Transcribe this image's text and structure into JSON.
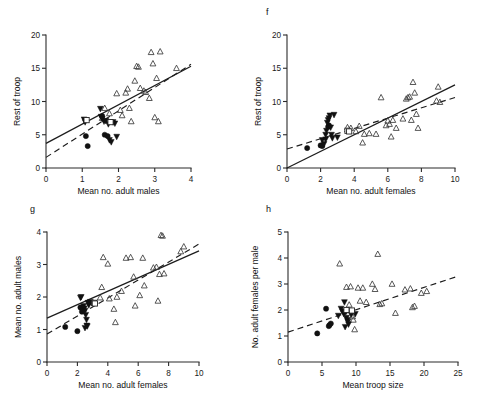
{
  "figure": {
    "title": "",
    "background": "#ffffff",
    "ink_color": "#1a1a1a",
    "width": 479,
    "height": 399
  },
  "legend_symbols": [
    {
      "key": "open-triangle",
      "name": "open-triangle-marker",
      "description": "open upward triangle"
    },
    {
      "key": "filled-circle",
      "name": "filled-circle-marker",
      "description": "filled circle"
    },
    {
      "key": "filled-down-triangle",
      "name": "filled-down-triangle-marker",
      "description": "filled downward triangle"
    },
    {
      "key": "open-square",
      "name": "open-square-marker",
      "description": "open square"
    }
  ],
  "panels": [
    {
      "id": "e",
      "label": "",
      "position": "top-left",
      "xlabel": "Mean no. adult males",
      "ylabel": "Rest of troop"
    },
    {
      "id": "f",
      "label": "f",
      "position": "top-right",
      "xlabel": "Mean no. adult females",
      "ylabel": "Rest of troop"
    },
    {
      "id": "g",
      "label": "g",
      "position": "bottom-left",
      "xlabel": "Mean no. adult females",
      "ylabel": "Mean no. adult males"
    },
    {
      "id": "h",
      "label": "h",
      "position": "bottom-right",
      "xlabel": "Mean troop size",
      "ylabel": "No. adult females per male"
    }
  ],
  "chart_data": [
    {
      "type": "scatter",
      "panel": "e",
      "title": "",
      "xlabel": "Mean no. adult males",
      "ylabel": "Rest of troop",
      "xlim": [
        0,
        4
      ],
      "ylim": [
        0,
        20
      ],
      "xticks": [
        0,
        1,
        2,
        3,
        4
      ],
      "yticks": [
        0,
        5,
        10,
        15,
        20
      ],
      "xticklabels": [
        "0",
        "1",
        "2",
        "3",
        "4"
      ],
      "yticklabels": [
        "0",
        "5",
        "10",
        "15",
        "20"
      ],
      "grid": false,
      "legend": "none",
      "series": [
        {
          "name": "open-triangle",
          "marker": "open-triangle",
          "points": [
            [
              1.62,
              9.0
            ],
            [
              1.75,
              8.2
            ],
            [
              1.95,
              11.2
            ],
            [
              2.1,
              7.9
            ],
            [
              2.2,
              11.3
            ],
            [
              2.25,
              11.9
            ],
            [
              2.3,
              9.0
            ],
            [
              2.35,
              7.0
            ],
            [
              2.45,
              13.1
            ],
            [
              2.5,
              15.3
            ],
            [
              2.55,
              15.2
            ],
            [
              2.6,
              12.0
            ],
            [
              2.7,
              11.6
            ],
            [
              2.75,
              11.4
            ],
            [
              2.85,
              10.5
            ],
            [
              2.9,
              17.4
            ],
            [
              2.95,
              15.7
            ],
            [
              3.0,
              7.6
            ],
            [
              3.05,
              13.5
            ],
            [
              3.1,
              7.0
            ],
            [
              3.15,
              17.5
            ],
            [
              3.6,
              15.0
            ],
            [
              1.55,
              7.5
            ],
            [
              2.05,
              8.7
            ]
          ]
        },
        {
          "name": "filled-circle",
          "marker": "filled-circle",
          "points": [
            [
              1.1,
              4.8
            ],
            [
              1.15,
              3.3
            ],
            [
              1.62,
              5.0
            ],
            [
              1.7,
              4.8
            ],
            [
              1.55,
              7.8
            ]
          ]
        },
        {
          "name": "filled-down-triangle",
          "marker": "filled-down-triangle",
          "points": [
            [
              1.05,
              7.3
            ],
            [
              1.08,
              6.9
            ],
            [
              1.5,
              8.9
            ],
            [
              1.52,
              7.7
            ],
            [
              1.55,
              7.4
            ],
            [
              1.6,
              7.0
            ],
            [
              1.65,
              7.1
            ],
            [
              1.72,
              6.6
            ],
            [
              1.75,
              4.2
            ],
            [
              1.8,
              3.9
            ],
            [
              1.9,
              6.7
            ],
            [
              1.95,
              4.7
            ],
            [
              1.85,
              6.9
            ]
          ]
        },
        {
          "name": "open-square",
          "marker": "open-square",
          "points": [
            [
              1.12,
              7.2
            ],
            [
              1.78,
              6.9
            ]
          ]
        }
      ],
      "fits": [
        {
          "style": "solid",
          "x": [
            0,
            4
          ],
          "y": [
            3.7,
            15.3
          ]
        },
        {
          "style": "dashed",
          "x": [
            0,
            4
          ],
          "y": [
            1.6,
            15.6
          ]
        }
      ]
    },
    {
      "type": "scatter",
      "panel": "f",
      "title": "",
      "xlabel": "Mean no. adult females",
      "ylabel": "Rest of troop",
      "xlim": [
        0,
        10
      ],
      "ylim": [
        0,
        20
      ],
      "xticks": [
        0,
        2,
        4,
        6,
        8,
        10
      ],
      "yticks": [
        0,
        5,
        10,
        15,
        20
      ],
      "xticklabels": [
        "0",
        "2",
        "4",
        "6",
        "8",
        "10"
      ],
      "yticklabels": [
        "0",
        "5",
        "10",
        "15",
        "20"
      ],
      "grid": false,
      "legend": "none",
      "series": [
        {
          "name": "open-triangle",
          "marker": "open-triangle",
          "points": [
            [
              3.6,
              6.1
            ],
            [
              3.8,
              6.0
            ],
            [
              4.1,
              5.5
            ],
            [
              4.5,
              3.8
            ],
            [
              4.6,
              5.1
            ],
            [
              4.9,
              5.2
            ],
            [
              5.3,
              5.1
            ],
            [
              5.6,
              10.6
            ],
            [
              6.0,
              7.1
            ],
            [
              6.1,
              6.6
            ],
            [
              6.2,
              4.7
            ],
            [
              6.3,
              7.2
            ],
            [
              6.5,
              6.0
            ],
            [
              6.9,
              7.4
            ],
            [
              7.1,
              10.4
            ],
            [
              7.2,
              10.6
            ],
            [
              7.3,
              10.7
            ],
            [
              7.4,
              7.2
            ],
            [
              7.5,
              12.9
            ],
            [
              7.6,
              11.3
            ],
            [
              7.7,
              8.1
            ],
            [
              7.8,
              6.0
            ],
            [
              8.9,
              10.1
            ],
            [
              9.0,
              12.2
            ],
            [
              9.1,
              9.9
            ],
            [
              5.9,
              6.4
            ],
            [
              4.3,
              6.3
            ]
          ]
        },
        {
          "name": "filled-circle",
          "marker": "filled-circle",
          "points": [
            [
              1.2,
              3.0
            ],
            [
              2.0,
              3.4
            ],
            [
              2.1,
              3.3
            ],
            [
              2.5,
              6.4
            ],
            [
              2.45,
              6.2
            ]
          ]
        },
        {
          "name": "filled-down-triangle",
          "marker": "filled-down-triangle",
          "points": [
            [
              2.1,
              4.2
            ],
            [
              2.2,
              3.6
            ],
            [
              2.3,
              5.0
            ],
            [
              2.35,
              5.6
            ],
            [
              2.4,
              6.8
            ],
            [
              2.45,
              7.2
            ],
            [
              2.5,
              7.5
            ],
            [
              2.55,
              7.9
            ],
            [
              2.6,
              6.1
            ],
            [
              2.65,
              5.0
            ],
            [
              2.7,
              4.5
            ],
            [
              2.8,
              8.0
            ],
            [
              3.0,
              4.6
            ],
            [
              2.3,
              4.3
            ]
          ]
        },
        {
          "name": "open-square",
          "marker": "open-square",
          "points": [
            [
              3.6,
              5.6
            ],
            [
              3.7,
              5.5
            ]
          ]
        }
      ],
      "fits": [
        {
          "style": "solid",
          "x": [
            0,
            10
          ],
          "y": [
            0.0,
            12.5
          ]
        },
        {
          "style": "dashed",
          "x": [
            0,
            10
          ],
          "y": [
            2.85,
            10.6
          ]
        }
      ]
    },
    {
      "type": "scatter",
      "panel": "g",
      "title": "",
      "xlabel": "Mean no. adult females",
      "ylabel": "Mean no. adult males",
      "xlim": [
        0,
        10
      ],
      "ylim": [
        0,
        4
      ],
      "xticks": [
        0,
        2,
        4,
        6,
        8,
        10
      ],
      "yticks": [
        0,
        1,
        2,
        3,
        4
      ],
      "xticklabels": [
        "0",
        "2",
        "4",
        "6",
        "8",
        "10"
      ],
      "yticklabels": [
        "0",
        "1",
        "2",
        "3",
        "4"
      ],
      "grid": false,
      "legend": "none",
      "series": [
        {
          "name": "open-triangle",
          "marker": "open-triangle",
          "points": [
            [
              3.6,
              2.3
            ],
            [
              3.7,
              3.22
            ],
            [
              4.0,
              3.02
            ],
            [
              4.1,
              1.95
            ],
            [
              4.4,
              1.63
            ],
            [
              4.5,
              1.22
            ],
            [
              4.9,
              2.18
            ],
            [
              5.2,
              3.2
            ],
            [
              5.5,
              3.22
            ],
            [
              5.7,
              2.62
            ],
            [
              5.8,
              1.73
            ],
            [
              6.1,
              2.05
            ],
            [
              6.3,
              3.2
            ],
            [
              6.4,
              2.35
            ],
            [
              7.0,
              2.9
            ],
            [
              7.2,
              2.92
            ],
            [
              7.3,
              1.88
            ],
            [
              7.4,
              2.7
            ],
            [
              7.5,
              3.9
            ],
            [
              7.6,
              3.88
            ],
            [
              7.7,
              2.72
            ],
            [
              8.8,
              3.4
            ],
            [
              9.0,
              3.55
            ],
            [
              3.5,
              1.98
            ],
            [
              4.6,
              2.0
            ]
          ]
        },
        {
          "name": "filled-circle",
          "marker": "filled-circle",
          "points": [
            [
              1.2,
              1.08
            ],
            [
              2.0,
              0.95
            ],
            [
              2.2,
              1.68
            ],
            [
              2.3,
              1.55
            ],
            [
              2.35,
              1.62
            ]
          ]
        },
        {
          "name": "filled-down-triangle",
          "marker": "filled-down-triangle",
          "points": [
            [
              2.2,
              1.98
            ],
            [
              2.25,
              2.0
            ],
            [
              2.4,
              1.72
            ],
            [
              2.45,
              1.65
            ],
            [
              2.5,
              1.58
            ],
            [
              2.55,
              1.45
            ],
            [
              2.6,
              1.3
            ],
            [
              2.62,
              1.12
            ],
            [
              2.65,
              1.1
            ],
            [
              2.7,
              1.82
            ],
            [
              2.75,
              1.75
            ],
            [
              2.5,
              1.05
            ],
            [
              2.85,
              1.85
            ]
          ]
        },
        {
          "name": "open-square",
          "marker": "open-square",
          "points": [
            [
              3.1,
              1.82
            ],
            [
              3.15,
              1.8
            ]
          ]
        }
      ],
      "fits": [
        {
          "style": "solid",
          "x": [
            0,
            10
          ],
          "y": [
            1.35,
            3.42
          ]
        },
        {
          "style": "dashed",
          "x": [
            0,
            10
          ],
          "y": [
            0.86,
            3.63
          ]
        }
      ]
    },
    {
      "type": "scatter",
      "panel": "h",
      "title": "",
      "xlabel": "Mean troop size",
      "ylabel": "No. adult females per male",
      "xlim": [
        0,
        25
      ],
      "ylim": [
        0,
        5
      ],
      "xticks": [
        0,
        5,
        10,
        15,
        20,
        25
      ],
      "yticks": [
        0,
        1,
        2,
        3,
        4,
        5
      ],
      "xticklabels": [
        "0",
        "5",
        "10",
        "15",
        "20",
        "25"
      ],
      "yticklabels": [
        "0",
        "1",
        "2",
        "3",
        "4",
        "5"
      ],
      "grid": false,
      "legend": "none",
      "series": [
        {
          "name": "open-triangle",
          "marker": "open-triangle",
          "points": [
            [
              7.6,
              3.78
            ],
            [
              8.6,
              2.88
            ],
            [
              9.2,
              2.9
            ],
            [
              9.5,
              1.75
            ],
            [
              9.6,
              1.62
            ],
            [
              9.8,
              1.25
            ],
            [
              10.3,
              2.85
            ],
            [
              10.6,
              2.35
            ],
            [
              11.5,
              2.3
            ],
            [
              12.4,
              3.0
            ],
            [
              12.8,
              2.8
            ],
            [
              13.2,
              4.15
            ],
            [
              13.5,
              2.22
            ],
            [
              13.8,
              2.25
            ],
            [
              15.3,
              3.0
            ],
            [
              15.8,
              1.88
            ],
            [
              17.2,
              2.78
            ],
            [
              18.0,
              2.82
            ],
            [
              18.3,
              2.1
            ],
            [
              18.6,
              2.15
            ],
            [
              19.6,
              2.65
            ],
            [
              20.4,
              2.72
            ],
            [
              9.0,
              2.2
            ],
            [
              11.0,
              2.85
            ]
          ]
        },
        {
          "name": "filled-circle",
          "marker": "filled-circle",
          "points": [
            [
              4.3,
              1.1
            ],
            [
              5.6,
              2.05
            ],
            [
              6.1,
              1.42
            ],
            [
              6.3,
              1.48
            ],
            [
              6.0,
              1.38
            ]
          ]
        },
        {
          "name": "filled-down-triangle",
          "marker": "filled-down-triangle",
          "points": [
            [
              7.4,
              1.78
            ],
            [
              7.8,
              2.05
            ],
            [
              8.0,
              1.95
            ],
            [
              8.2,
              1.85
            ],
            [
              8.3,
              2.3
            ],
            [
              8.5,
              1.92
            ],
            [
              8.6,
              1.7
            ],
            [
              8.7,
              1.62
            ],
            [
              8.8,
              1.55
            ],
            [
              8.9,
              1.45
            ],
            [
              9.1,
              1.95
            ],
            [
              9.3,
              1.82
            ],
            [
              9.9,
              1.85
            ],
            [
              8.4,
              1.35
            ]
          ]
        },
        {
          "name": "open-square",
          "marker": "open-square",
          "points": [
            [
              8.6,
              2.0
            ],
            [
              9.4,
              1.98
            ]
          ]
        }
      ],
      "fits": [
        {
          "style": "dashed",
          "x": [
            0,
            25
          ],
          "y": [
            1.15,
            3.3
          ]
        }
      ]
    }
  ]
}
